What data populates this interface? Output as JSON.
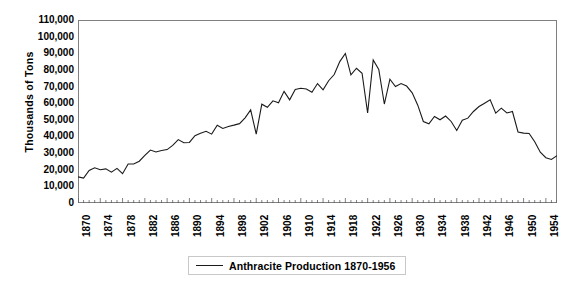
{
  "chart_data": {
    "type": "line",
    "title": "",
    "xlabel": "",
    "ylabel": "Thousands of Tons",
    "ylim": [
      0,
      110000
    ],
    "ytick_step": 10000,
    "yticks": [
      "110,000",
      "100,000",
      "90,000",
      "80,000",
      "70,000",
      "60,000",
      "50,000",
      "40,000",
      "30,000",
      "20,000",
      "10,000",
      "0"
    ],
    "xlim": [
      1870,
      1956
    ],
    "xtick_labels": [
      "1870",
      "1874",
      "1878",
      "1882",
      "1886",
      "1890",
      "1894",
      "1898",
      "1902",
      "1906",
      "1910",
      "1914",
      "1918",
      "1922",
      "1926",
      "1930",
      "1934",
      "1938",
      "1942",
      "1946",
      "1950",
      "1954"
    ],
    "xtick_step": 4,
    "xminor_step": 1,
    "grid": false,
    "legend_position": "bottom",
    "series": [
      {
        "name": "Anthracite Production 1870-1956",
        "color": "#1a1a1a",
        "x": [
          1870,
          1871,
          1872,
          1873,
          1874,
          1875,
          1876,
          1877,
          1878,
          1879,
          1880,
          1881,
          1882,
          1883,
          1884,
          1885,
          1886,
          1887,
          1888,
          1889,
          1890,
          1891,
          1892,
          1893,
          1894,
          1895,
          1896,
          1897,
          1898,
          1899,
          1900,
          1901,
          1902,
          1903,
          1904,
          1905,
          1906,
          1907,
          1908,
          1909,
          1910,
          1911,
          1912,
          1913,
          1914,
          1915,
          1916,
          1917,
          1918,
          1919,
          1920,
          1921,
          1922,
          1923,
          1924,
          1925,
          1926,
          1927,
          1928,
          1929,
          1930,
          1931,
          1932,
          1933,
          1934,
          1935,
          1936,
          1937,
          1938,
          1939,
          1940,
          1941,
          1942,
          1943,
          1944,
          1945,
          1946,
          1947,
          1948,
          1949,
          1950,
          1951,
          1952,
          1953,
          1954,
          1955,
          1956
        ],
        "values": [
          15700,
          15000,
          19600,
          21200,
          20000,
          20500,
          18500,
          20800,
          17600,
          23400,
          23400,
          25100,
          28600,
          31800,
          30700,
          31600,
          32100,
          34600,
          38100,
          36200,
          36400,
          40500,
          41900,
          43100,
          41400,
          46700,
          44800,
          46000,
          46800,
          47700,
          51200,
          56000,
          41400,
          59400,
          57500,
          61400,
          60200,
          67100,
          62000,
          68200,
          69000,
          68500,
          66600,
          71800,
          68000,
          73500,
          77200,
          85000,
          89900,
          77000,
          81000,
          78000,
          54100,
          86000,
          80300,
          59500,
          74400,
          70000,
          71800,
          70300,
          66200,
          58800,
          49000,
          47600,
          52000,
          50000,
          52300,
          49000,
          43600,
          49800,
          51000,
          55000,
          58000,
          60000,
          62000,
          54000,
          57000,
          54100,
          55000,
          42700,
          42000,
          41800,
          36800,
          30500,
          27200,
          26200,
          28500
        ]
      }
    ]
  },
  "legend": {
    "entry_label": "Anthracite Production 1870-1956"
  },
  "axis": {
    "y_title": "Thousands of Tons"
  }
}
